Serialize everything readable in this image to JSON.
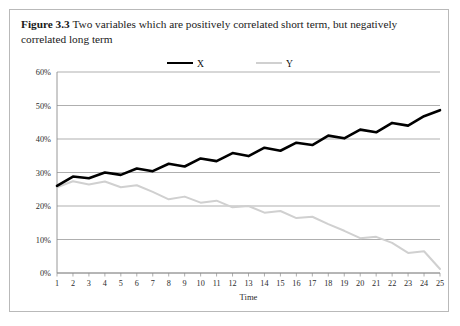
{
  "figure": {
    "label": "Figure 3.3",
    "caption": "Two variables which are positively correlated short term, but negatively correlated long term"
  },
  "legend": {
    "position": "top-center",
    "entries": [
      {
        "name": "X",
        "color": "#000000"
      },
      {
        "name": "Y",
        "color": "#d0d0d0"
      }
    ]
  },
  "chart_data": {
    "type": "line",
    "title": "",
    "xlabel": "Time",
    "ylabel": "",
    "xlim": [
      1,
      25
    ],
    "ylim": [
      0,
      60
    ],
    "grid": true,
    "y_tick_labels": [
      "0%",
      "10%",
      "20%",
      "30%",
      "40%",
      "50%",
      "60%"
    ],
    "y_tick_values": [
      0,
      10,
      20,
      30,
      40,
      50,
      60
    ],
    "x": [
      1,
      2,
      3,
      4,
      5,
      6,
      7,
      8,
      9,
      10,
      11,
      12,
      13,
      14,
      15,
      16,
      17,
      18,
      19,
      20,
      21,
      22,
      23,
      24,
      25
    ],
    "x_tick_labels": [
      "1",
      "2",
      "3",
      "4",
      "5",
      "6",
      "7",
      "8",
      "9",
      "10",
      "11",
      "12",
      "13",
      "14",
      "15",
      "16",
      "17",
      "18",
      "19",
      "20",
      "21",
      "22",
      "23",
      "24",
      "25"
    ],
    "series": [
      {
        "name": "X",
        "color": "#000000",
        "width": 2.6,
        "values": [
          26.0,
          28.8,
          28.3,
          30.0,
          29.3,
          31.2,
          30.4,
          32.6,
          31.8,
          34.2,
          33.4,
          35.8,
          34.9,
          37.4,
          36.5,
          38.9,
          38.2,
          41.0,
          40.2,
          42.8,
          42.0,
          44.8,
          44.0,
          46.8,
          48.6
        ]
      },
      {
        "name": "Y",
        "color": "#d0d0d0",
        "width": 2.0,
        "values": [
          25.6,
          27.4,
          26.4,
          27.3,
          25.6,
          26.2,
          24.2,
          22.0,
          22.8,
          21.0,
          21.6,
          19.6,
          20.0,
          18.0,
          18.5,
          16.4,
          16.8,
          14.6,
          12.6,
          10.4,
          10.8,
          9.0,
          6.0,
          6.5,
          1.2
        ]
      }
    ],
    "annotations": []
  }
}
